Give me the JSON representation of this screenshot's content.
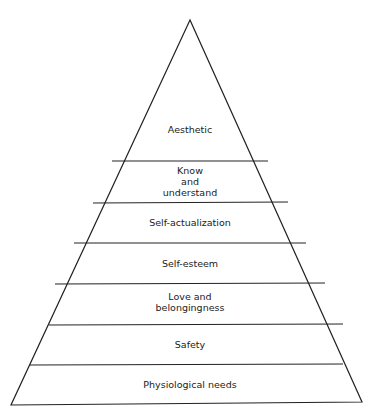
{
  "diagram": {
    "type": "pyramid",
    "levels_top_to_bottom": [
      {
        "label": "Aesthetic"
      },
      {
        "label": "Know\nand\nunderstand",
        "lines": [
          "Know",
          "and",
          "understand"
        ]
      },
      {
        "label": "Self-actualization"
      },
      {
        "label": "Self-esteem"
      },
      {
        "label": "Love and\nbelongingness",
        "lines": [
          "Love and",
          "belongingness"
        ]
      },
      {
        "label": "Safety"
      },
      {
        "label": "Physiological needs"
      }
    ],
    "colors": {
      "stroke": "#222222",
      "background": "#ffffff"
    }
  }
}
